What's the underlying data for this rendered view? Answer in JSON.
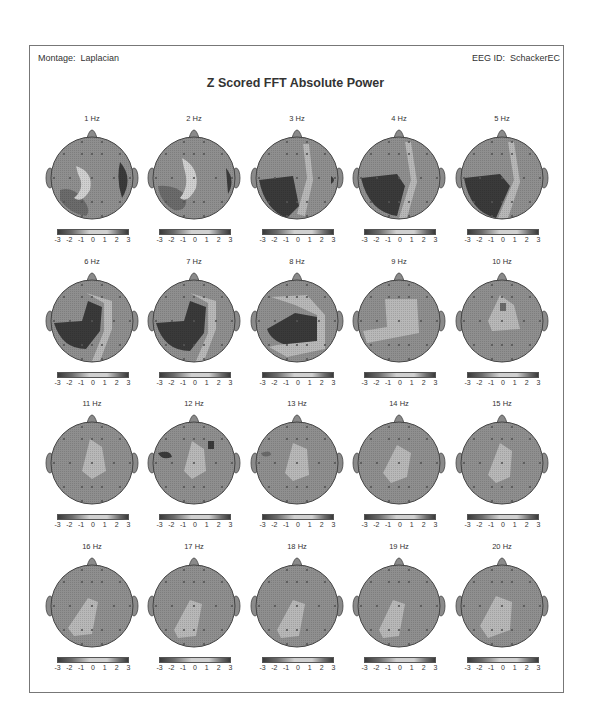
{
  "header": {
    "montage_label": "Montage:",
    "montage_value": "Laplacian",
    "eeg_id_label": "EEG ID:",
    "eeg_id_value": "SchackerEC",
    "title": "Z Scored FFT Absolute Power"
  },
  "colors": {
    "very_low": "#3a3a3a",
    "low": "#6b6b6b",
    "neutral": "#8f8f8f",
    "elevated": "#b8b8b8",
    "high": "#d0d0d0",
    "outline": "#444444"
  },
  "chart_data": {
    "type": "heatmap",
    "title": "Z Scored FFT Absolute Power",
    "subtitle_left": "Montage: Laplacian",
    "subtitle_right": "EEG ID: SchackerEC",
    "layout": {
      "rows": 4,
      "cols": 5
    },
    "colorbar": {
      "ticks": [
        "-3",
        "-2",
        "-1",
        "0",
        "1",
        "2",
        "3"
      ],
      "range": [
        -3,
        3
      ]
    },
    "maps": [
      {
        "label": "1 Hz",
        "pattern": "left-temporal-low, right-temporal-very-low, central-band-elevated"
      },
      {
        "label": "2 Hz",
        "pattern": "left-posterior-low, right-temporal-very-low, central-band-elevated"
      },
      {
        "label": "3 Hz",
        "pattern": "left-hemisphere-very-low, left-frontal-neutral, right-temporal-very-low-spot"
      },
      {
        "label": "4 Hz",
        "pattern": "left-hemisphere-very-low, left-frontal-neutral"
      },
      {
        "label": "5 Hz",
        "pattern": "left-hemisphere-very-low, left-frontal-neutral"
      },
      {
        "label": "6 Hz",
        "pattern": "left-central-posterior-very-low"
      },
      {
        "label": "7 Hz",
        "pattern": "left-central-posterior-very-low"
      },
      {
        "label": "8 Hz",
        "pattern": "central-very-low, frontal-elevated"
      },
      {
        "label": "9 Hz",
        "pattern": "central-low-spot, surrounding-elevated"
      },
      {
        "label": "10 Hz",
        "pattern": "central-elevated, small-low-spot"
      },
      {
        "label": "11 Hz",
        "pattern": "central-elevated"
      },
      {
        "label": "12 Hz",
        "pattern": "central-elevated, left-frontal-very-low, right-frontal-low-spot"
      },
      {
        "label": "13 Hz",
        "pattern": "central-elevated, left-frontal-low-spot"
      },
      {
        "label": "14 Hz",
        "pattern": "central-elevated"
      },
      {
        "label": "15 Hz",
        "pattern": "central-elevated"
      },
      {
        "label": "16 Hz",
        "pattern": "left-central-posterior-elevated"
      },
      {
        "label": "17 Hz",
        "pattern": "left-central-posterior-elevated"
      },
      {
        "label": "18 Hz",
        "pattern": "left-central-posterior-elevated"
      },
      {
        "label": "19 Hz",
        "pattern": "left-central-posterior-elevated"
      },
      {
        "label": "20 Hz",
        "pattern": "left-central-posterior-elevated"
      }
    ]
  }
}
